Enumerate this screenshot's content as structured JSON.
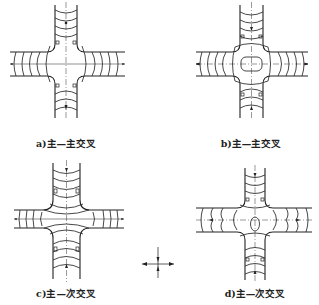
{
  "figure": {
    "panels": [
      {
        "id": "a",
        "caption": "a)主—主交叉",
        "type": "major-major"
      },
      {
        "id": "b",
        "caption": "b)主—主交叉",
        "type": "major-major"
      },
      {
        "id": "c",
        "caption": "c)主—次交叉",
        "type": "major-minor"
      },
      {
        "id": "d",
        "caption": "d)主—次交叉",
        "type": "major-minor"
      }
    ],
    "legend": {
      "symbol": "drainage-direction-arrows-icon"
    }
  }
}
